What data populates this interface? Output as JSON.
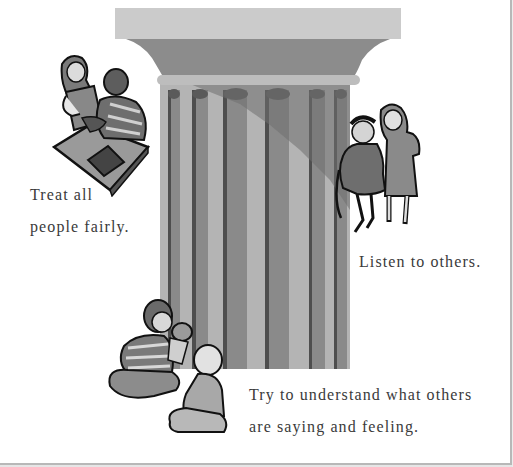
{
  "illustration": {
    "subject": "classical-column",
    "colors": {
      "abacus": "#cbcbcb",
      "echinus": "#8c8c8c",
      "astragal": "#bdbdbd",
      "flute_light": "#b4b4b4",
      "flute_mid": "#8a8a8a",
      "flute_dark": "#4e4e4e",
      "shadow": "#7b7b7b"
    }
  },
  "captions": {
    "fairness": {
      "line1": "Treat all",
      "line2": "people fairly."
    },
    "listening": {
      "line1": "Listen to others."
    },
    "empathy": {
      "line1": "Try to understand what others",
      "line2": "are saying and feeling."
    }
  },
  "figures": [
    {
      "name": "two-children-with-book",
      "label": "Two children studying a book at a table"
    },
    {
      "name": "two-girls-sitting",
      "label": "Two girls, one sitting on a chair"
    },
    {
      "name": "children-with-puppet",
      "label": "Boy with hand puppet and kneeling child"
    }
  ]
}
